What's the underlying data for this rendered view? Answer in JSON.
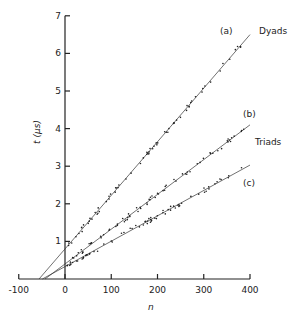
{
  "chart_data": {
    "type": "scatter",
    "title": "",
    "xlabel": "n",
    "ylabel": "t (µs)",
    "xlim": [
      -100,
      400
    ],
    "ylim": [
      0,
      7
    ],
    "xticks": [
      -100,
      0,
      100,
      200,
      300,
      400
    ],
    "xtick_labels": [
      "-100",
      "0",
      "100",
      "200",
      "300",
      "400"
    ],
    "yticks": [
      1,
      2,
      3,
      4,
      5,
      6,
      7
    ],
    "ytick_labels": [
      "1",
      "2",
      "3",
      "4",
      "5",
      "6",
      "7"
    ],
    "grid": false,
    "legend": "inline labels at line ends",
    "series": [
      {
        "name": "(a)",
        "group_label": "Dyads",
        "fit": {
          "intercept": 0.8,
          "slope": 0.01425
        },
        "x_range": [
          0,
          400
        ],
        "extrapolated_to_t0": -56
      },
      {
        "name": "(b)",
        "group_label": "Triads",
        "fit": {
          "intercept": 0.4,
          "slope": 0.00925
        },
        "x_range": [
          0,
          400
        ],
        "extrapolated_to_t0": -43
      },
      {
        "name": "(c)",
        "group_label": "",
        "fit": {
          "intercept": 0.33,
          "slope": 0.00675
        },
        "x_range": [
          0,
          400
        ],
        "extrapolated_to_t0": -49
      }
    ]
  },
  "labels": {
    "a": "(a)",
    "b": "(b)",
    "c": "(c)",
    "dyads": "Dyads",
    "triads": "Triads",
    "xlabel": "n",
    "ylabel": "t (µs)"
  }
}
